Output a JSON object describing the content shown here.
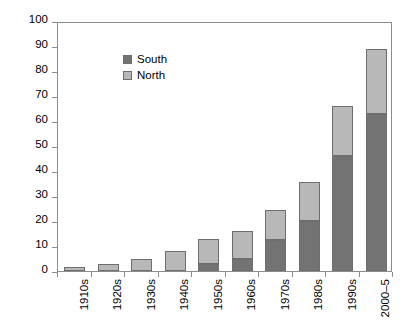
{
  "chart_data": {
    "type": "bar",
    "subtype": "stacked-vertical",
    "title": "",
    "subtitle": "",
    "xlabel": "",
    "ylabel": "",
    "categories": [
      "1910s",
      "1920s",
      "1930s",
      "1940s",
      "1950s",
      "1960s",
      "1970s",
      "1980s",
      "1990s",
      "2000–5"
    ],
    "series": [
      {
        "name": "South",
        "color": "#737373",
        "values": [
          0,
          0,
          0,
          0,
          3,
          5,
          12.5,
          20,
          46,
          63
        ]
      },
      {
        "name": "North",
        "color": "#b8b8b8",
        "values": [
          1.5,
          3,
          5,
          8,
          10,
          11,
          12,
          15.5,
          20,
          26
        ]
      }
    ],
    "totals": [
      1.5,
      3,
      5,
      8,
      13,
      16,
      24.5,
      35.5,
      66,
      89
    ],
    "ylim": [
      0,
      100
    ],
    "ytick_step": 10,
    "yticks": [
      0,
      10,
      20,
      30,
      40,
      50,
      60,
      70,
      80,
      90,
      100
    ],
    "ytick_labels": [
      "0",
      "10",
      "20",
      "30",
      "40",
      "50",
      "60",
      "70",
      "80",
      "90",
      "100"
    ],
    "grid": false,
    "legend_position": "top-left",
    "legend": [
      "South",
      "North"
    ]
  },
  "legend": {
    "entries": [
      {
        "label": "South",
        "color": "#737373"
      },
      {
        "label": "North",
        "color": "#b8b8b8"
      }
    ]
  }
}
